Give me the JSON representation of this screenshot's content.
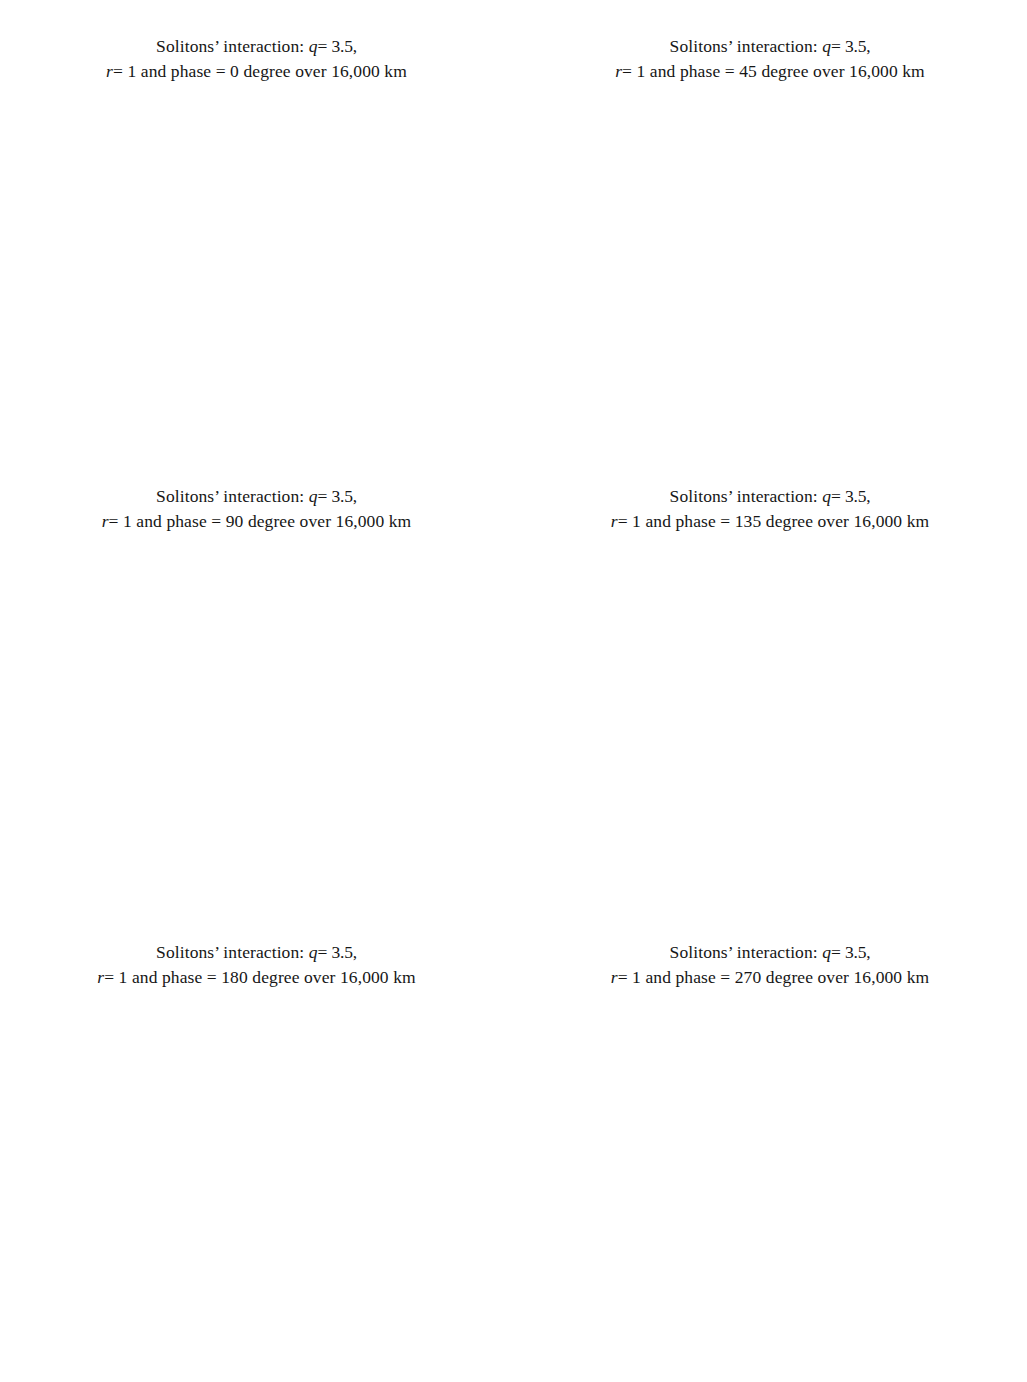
{
  "figure": {
    "kind": "multi-panel waterfall plot figure",
    "panel_count": 6,
    "shared": {
      "title_line1": "Solitons’ interaction: q = 3.5,",
      "title_prefix2": "r = 1 and phase = ",
      "title_suffix2": " degree over 16,000 km",
      "ylabel": "Arbitrary units",
      "y_exponent": "× 10",
      "y_exponent_sup": "−3",
      "x_ticks": [
        0,
        20,
        40,
        60,
        80,
        100,
        120,
        140
      ],
      "x_tick_labels": [
        "0",
        "20",
        "40",
        "60",
        "80",
        "100",
        "120",
        "140"
      ],
      "xlim": [
        0,
        140
      ],
      "n_traces": 41,
      "stroke_color": "#111111",
      "background": "#ffffff"
    }
  },
  "chart_data": [
    {
      "id": "a",
      "letter": "(a)",
      "type": "line",
      "subtype": "waterfall",
      "title": "Solitons’ interaction: q = 3.5, r = 1 and phase = 0 degree over 16,000 km",
      "params": {
        "q": 3.5,
        "r": 1,
        "phase_degrees": 0,
        "distance": "16,000 km"
      },
      "xlabel": "",
      "ylabel": "Arbitrary units",
      "y_left_ticks": [
        0,
        2,
        4,
        6,
        8
      ],
      "y_left_tick_labels": [
        "0",
        "2",
        "4",
        "6",
        "8"
      ],
      "y_left_unit": "× 10⁻³",
      "y_left_lim": [
        0,
        8
      ],
      "y_right_ticks": [
        0,
        10,
        20,
        30,
        40
      ],
      "y_right_tick_labels": [
        "0",
        "10",
        "20",
        "30",
        "40"
      ],
      "y_right_lim": [
        0,
        40
      ],
      "x": [
        0,
        140
      ],
      "x_ticks": [
        0,
        20,
        40,
        60,
        80,
        100,
        120,
        140
      ],
      "traces": 41,
      "description": "Two solitons collide periodically and fuse into a tall narrow central spike at x=65; breathing period repeats three times.",
      "soliton_left_start": 40,
      "soliton_right_start": 88,
      "spike_center": 65,
      "spike_amplitude": 4.2,
      "grid": false,
      "legend": "none"
    },
    {
      "id": "b",
      "letter": "(b)",
      "type": "line",
      "subtype": "waterfall",
      "title": "Solitons’ interaction: q = 3.5, r = 1 and phase = 45 degree over 16,000 km",
      "params": {
        "q": 3.5,
        "r": 1,
        "phase_degrees": 45,
        "distance": "16,000 km"
      },
      "xlabel": "",
      "ylabel": "Arbitrary units",
      "y_left_ticks": [
        0,
        2,
        4
      ],
      "y_left_tick_labels": [
        "0",
        "2",
        "4"
      ],
      "y_left_unit": "× 10⁻³",
      "y_left_lim": [
        0,
        4
      ],
      "y_right_ticks": [
        0,
        5,
        10,
        15,
        20,
        25,
        30,
        35,
        40
      ],
      "y_right_tick_labels": [
        "0",
        "5",
        "10",
        "15",
        "20",
        "25",
        "30",
        "35",
        "40"
      ],
      "y_right_lim": [
        0,
        40
      ],
      "x": [
        0,
        140
      ],
      "x_ticks": [
        0,
        20,
        40,
        60,
        80,
        100,
        120,
        140
      ],
      "traces": 41,
      "description": "Two solitons repel: left peak drifts from x=40 to x=24, right peak drifts from x=90 to x=101.",
      "soliton_left_start": 40,
      "soliton_left_end": 24,
      "soliton_right_start": 90,
      "soliton_right_end": 101,
      "grid": false,
      "legend": "none"
    },
    {
      "id": "c",
      "letter": "(c)",
      "type": "line",
      "subtype": "waterfall",
      "title": "Solitons’ interaction: q = 3.5, r = 1 and phase = 90 degree over 16,000 km",
      "params": {
        "q": 3.5,
        "r": 1,
        "phase_degrees": 90,
        "distance": "16,000 km"
      },
      "xlabel": "",
      "ylabel": "Arbitrary units",
      "y_left_ticks": [
        0,
        2,
        4
      ],
      "y_left_tick_labels": [
        "0",
        "2",
        "4"
      ],
      "y_left_unit": "× 10⁻³",
      "y_left_lim": [
        0,
        4
      ],
      "y_right_ticks": [
        0,
        5,
        10,
        15,
        20,
        25,
        30,
        35,
        40
      ],
      "y_right_tick_labels": [
        "0",
        "5",
        "10",
        "15",
        "20",
        "25",
        "30",
        "35",
        "40"
      ],
      "y_right_lim": [
        0,
        40
      ],
      "x": [
        0,
        140
      ],
      "x_ticks": [
        0,
        20,
        40,
        60,
        80,
        100,
        120,
        140
      ],
      "traces": 41,
      "description": "Asymmetric repulsion; left soliton drifts from x=38 to x=20, right soliton drifts from x=92 to x=105 then a small secondary spike emerges near x=74 at the top.",
      "soliton_left_start": 38,
      "soliton_left_end": 20,
      "soliton_right_start": 92,
      "soliton_right_end": 105,
      "spike_center": 74,
      "grid": false,
      "legend": "none"
    },
    {
      "id": "d",
      "letter": "(d)",
      "type": "line",
      "subtype": "waterfall",
      "title": "Solitons’ interaction: q = 3.5, r = 1 and phase = 135 degree over 16,000 km",
      "params": {
        "q": 3.5,
        "r": 1,
        "phase_degrees": 135,
        "distance": "16,000 km"
      },
      "xlabel": "",
      "ylabel": "Arbitrary units",
      "y_left_ticks": [
        0,
        2,
        4
      ],
      "y_left_tick_labels": [
        "0",
        "2",
        "4"
      ],
      "y_left_unit": "× 10⁻³",
      "y_left_lim": [
        0,
        4
      ],
      "y_right_ticks": [
        0,
        5,
        10,
        15,
        20,
        25,
        30,
        35,
        40
      ],
      "y_right_tick_labels": [
        "0",
        "5",
        "10",
        "15",
        "20",
        "25",
        "30",
        "35",
        "40"
      ],
      "y_right_lim": [
        0,
        40
      ],
      "x": [
        0,
        140
      ],
      "x_ticks": [
        0,
        20,
        40,
        60,
        80,
        100,
        120,
        140
      ],
      "traces": 41,
      "description": "Symmetric repulsion: left peak from x=38 to x=26, right peak from x=92 to x=102.",
      "soliton_left_start": 38,
      "soliton_left_end": 26,
      "soliton_right_start": 92,
      "soliton_right_end": 102,
      "grid": false,
      "legend": "none"
    },
    {
      "id": "e",
      "letter": "(e)",
      "type": "line",
      "subtype": "waterfall",
      "title": "Solitons’ interaction: q = 3.5, r = 1 and phase = 180 degree over 16,000 km",
      "params": {
        "q": 3.5,
        "r": 1,
        "phase_degrees": 180,
        "distance": "16,000 km"
      },
      "xlabel": "",
      "ylabel": "Arbitrary units",
      "y_left_ticks": [
        0,
        2,
        4
      ],
      "y_left_tick_labels": [
        "0",
        "2",
        "4"
      ],
      "y_left_unit": "× 10⁻³",
      "y_left_lim": [
        0,
        4
      ],
      "y_right_ticks": [
        0,
        5,
        10,
        15,
        20,
        25,
        30,
        35,
        40
      ],
      "y_right_tick_labels": [
        "0",
        "5",
        "10",
        "15",
        "20",
        "25",
        "30",
        "35",
        "40"
      ],
      "y_right_lim": [
        0,
        40
      ],
      "x": [
        0,
        140
      ],
      "x_ticks": [
        0,
        20,
        40,
        60,
        80,
        100,
        120,
        140
      ],
      "traces": 41,
      "description": "Fully symmetric, nearly parallel tracks: left peak x=38 to x=33, right peak x=92 to x=96; strongest mutual repulsion keeps them apart.",
      "soliton_left_start": 38,
      "soliton_left_end": 33,
      "soliton_right_start": 92,
      "soliton_right_end": 96,
      "grid": false,
      "legend": "none"
    },
    {
      "id": "f",
      "letter": "(f)",
      "type": "line",
      "subtype": "waterfall",
      "title": "Solitons’ interaction: q = 3.5, r = 1 and phase = 270 degree over 16,000 km",
      "params": {
        "q": 3.5,
        "r": 1,
        "phase_degrees": 270,
        "distance": "16,000 km"
      },
      "xlabel": "",
      "ylabel": "Arbitrary units",
      "y_left_ticks": [
        0,
        2,
        4
      ],
      "y_left_tick_labels": [
        "0",
        "2",
        "4"
      ],
      "y_left_unit": "× 10⁻³",
      "y_left_lim": [
        0,
        4
      ],
      "y_right_ticks": [
        0,
        5,
        10,
        15,
        20,
        25,
        30,
        35,
        40
      ],
      "y_right_tick_labels": [
        "0",
        "5",
        "10",
        "15",
        "20",
        "25",
        "30",
        "35",
        "40"
      ],
      "y_right_lim": [
        0,
        40
      ],
      "x": [
        0,
        140
      ],
      "x_ticks": [
        0,
        20,
        40,
        60,
        80,
        100,
        120,
        140
      ],
      "traces": 41,
      "description": "Mirror of panel (c): left soliton drifts from x=38 to x=22 then a narrow spike rises near x=57 at the top; right soliton drifts from x=92 to x=108.",
      "soliton_left_start": 38,
      "soliton_left_end": 22,
      "soliton_right_start": 92,
      "soliton_right_end": 108,
      "spike_center": 57,
      "grid": false,
      "legend": "none"
    }
  ],
  "panels": [
    {
      "id": "a",
      "letter": "(a)",
      "phase": "0",
      "title_line1": "Solitons’ interaction: q = 3.5,",
      "title_line2": "r = 1 and phase = 0 degree over 16,000 km"
    },
    {
      "id": "b",
      "letter": "(b)",
      "phase": "45",
      "title_line1": "Solitons’ interaction: q = 3.5,",
      "title_line2": "r = 1 and phase = 45 degree over 16,000 km"
    },
    {
      "id": "c",
      "letter": "(c)",
      "phase": "90",
      "title_line1": "Solitons’ interaction: q = 3.5,",
      "title_line2": "r = 1 and phase = 90 degree over 16,000 km"
    },
    {
      "id": "d",
      "letter": "(d)",
      "phase": "135",
      "title_line1": "Solitons’ interaction: q = 3.5,",
      "title_line2": "r = 1 and phase = 135 degree over 16,000 km"
    },
    {
      "id": "e",
      "letter": "(e)",
      "phase": "180",
      "title_line1": "Solitons’ interaction: q = 3.5,",
      "title_line2": "r = 1 and phase = 180 degree over 16,000 km"
    },
    {
      "id": "f",
      "letter": "(f)",
      "phase": "270",
      "title_line1": "Solitons’ interaction: q = 3.5,",
      "title_line2": "r = 1 and phase = 270 degree over 16,000 km"
    }
  ],
  "title_tokens": {
    "solitons_interaction": "Solitons’ interaction:",
    "q_sym": "q",
    "q_val": "= 3.5,",
    "r_sym": "r",
    "r_val": "= 1 and phase =",
    "deg_over": "degree over 16,000 km"
  }
}
